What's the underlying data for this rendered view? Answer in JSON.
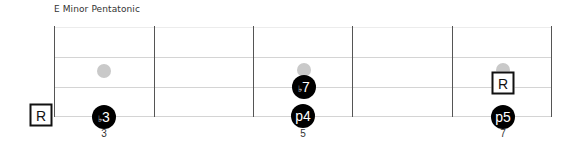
{
  "title": "E Minor Pentatonic",
  "colors": {
    "note_fill": "#000000",
    "note_text": "#ffffff",
    "ghost_dot": "#c9c9c9",
    "fret_line": "#555555",
    "string_line": "#d4d4d4",
    "root_border": "#111111"
  },
  "fretboard": {
    "fret_numbers": [
      "3",
      "5",
      "7"
    ],
    "notes": [
      {
        "label_flat": "♭",
        "label": "3",
        "fret": 3,
        "string": "low"
      },
      {
        "label_flat": "♭",
        "label": "7",
        "fret": 5,
        "string": "second"
      },
      {
        "label_flat": "",
        "label": "p4",
        "fret": 5,
        "string": "low"
      },
      {
        "label_flat": "",
        "label": "p5",
        "fret": 7,
        "string": "low"
      }
    ],
    "roots": [
      {
        "label": "R",
        "position": "open-low"
      },
      {
        "label": "R",
        "position": "fret7-second"
      }
    ],
    "ghost_dots": [
      {
        "fret": 3,
        "string": "third"
      },
      {
        "fret": 5,
        "string": "third"
      },
      {
        "fret": 7,
        "string": "third"
      }
    ]
  }
}
